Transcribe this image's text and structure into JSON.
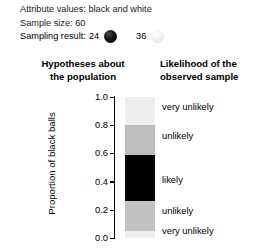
{
  "header": {
    "attribute_label": "Attribute values:",
    "attribute_value": "black and white",
    "attribute_line": "Attribute values: black and white",
    "sample_size_line": "Sample size: 60",
    "sampling_result_label": "Sampling result:",
    "black_count": "24",
    "white_count": "36",
    "black_ball_icon": "black-ball-icon",
    "white_ball_icon": "white-ball-icon"
  },
  "titles": {
    "left_line1": "Hypotheses about",
    "left_line2": "the population",
    "right_line1": "Likelihood of the",
    "right_line2": "observed sample"
  },
  "chart_data": {
    "type": "heatmap",
    "xlabel": "",
    "ylabel": "Proportion of black balls",
    "ylim": [
      0.0,
      1.0
    ],
    "grid": false,
    "legend": "right",
    "yticks": [
      "1.0",
      "0.8",
      "0.6",
      "0.4",
      "0.2",
      "0.0"
    ],
    "ytick_values": [
      1.0,
      0.8,
      0.6,
      0.4,
      0.2,
      0.0
    ],
    "bands": [
      {
        "label": "very unlikely",
        "y_top": 1.0,
        "y_bottom": 0.8,
        "color": "#eeeeec",
        "label_at": 0.93
      },
      {
        "label": "unlikely",
        "y_top": 0.8,
        "y_bottom": 0.59,
        "color": "#bdbdbb",
        "label_at": 0.72
      },
      {
        "label": "likely",
        "y_top": 0.59,
        "y_bottom": 0.26,
        "color": "#000000",
        "label_at": 0.41
      },
      {
        "label": "unlikely",
        "y_top": 0.26,
        "y_bottom": 0.05,
        "color": "#c2c2c0",
        "label_at": 0.19
      },
      {
        "label": "very unlikely",
        "y_top": 0.05,
        "y_bottom": 0.0,
        "color": "#eeeeec",
        "label_at": 0.05
      }
    ],
    "observed_proportion": 0.4
  }
}
